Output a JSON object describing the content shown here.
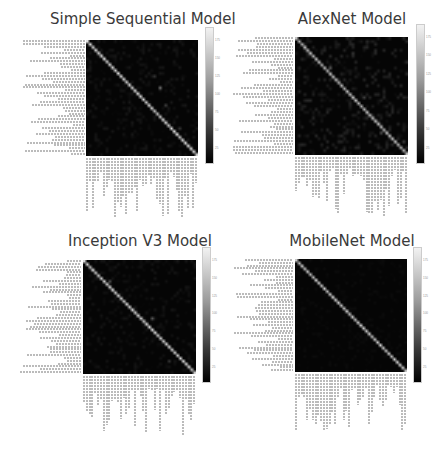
{
  "chart_data": [
    {
      "type": "heatmap",
      "title": "Simple Sequential Model",
      "n_classes": 40,
      "colorbar_ticks": [
        25,
        50,
        75,
        100,
        125,
        150,
        175
      ],
      "colormap": "gray",
      "diagonal_level": 0.8,
      "noise_level": 0.08,
      "outliers": [
        [
          16,
          26,
          0.45
        ],
        [
          12,
          24,
          0.2
        ],
        [
          22,
          28,
          0.25
        ],
        [
          30,
          33,
          0.2
        ]
      ]
    },
    {
      "type": "heatmap",
      "title": "AlexNet Model",
      "n_classes": 40,
      "colorbar_ticks": [
        25,
        50,
        75,
        100,
        125,
        150,
        175
      ],
      "colormap": "gray",
      "diagonal_level": 0.7,
      "noise_level": 0.15,
      "outliers": [
        [
          10,
          12,
          0.35
        ],
        [
          20,
          24,
          0.25
        ],
        [
          32,
          30,
          0.3
        ],
        [
          35,
          38,
          0.25
        ],
        [
          5,
          20,
          0.2
        ]
      ]
    },
    {
      "type": "heatmap",
      "title": "Inception V3 Model",
      "n_classes": 40,
      "colorbar_ticks": [
        25,
        50,
        75,
        100,
        125,
        150,
        175
      ],
      "colormap": "gray",
      "diagonal_level": 0.8,
      "noise_level": 0.07,
      "outliers": [
        [
          7,
          9,
          0.3
        ],
        [
          20,
          24,
          0.35
        ],
        [
          35,
          30,
          0.2
        ]
      ]
    },
    {
      "type": "heatmap",
      "title": "MobileNet Model",
      "n_classes": 40,
      "colorbar_ticks": [
        25,
        50,
        75,
        100,
        125,
        150,
        175
      ],
      "colormap": "gray",
      "diagonal_level": 0.75,
      "noise_level": 0.03,
      "outliers": []
    }
  ],
  "panels": [
    {
      "title": "Simple Sequential Model"
    },
    {
      "title": "AlexNet Model"
    },
    {
      "title": "Inception V3 Model"
    },
    {
      "title": "MobileNet Model"
    }
  ]
}
